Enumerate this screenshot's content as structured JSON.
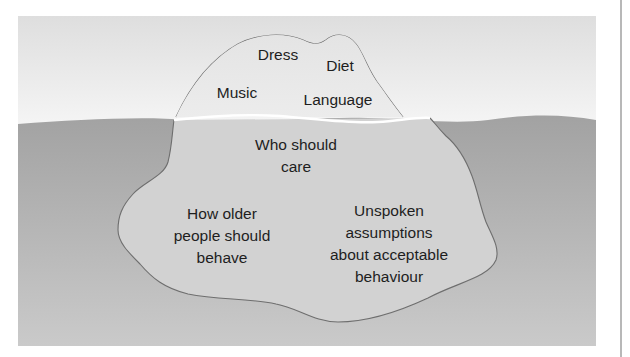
{
  "diagram": {
    "type": "iceberg",
    "colors": {
      "sky_top": "#e0e0e0",
      "sky_bottom": "#f4f4f4",
      "water_top": "#a3a3a3",
      "water_bottom": "#c9c9c9",
      "ice_above": "#e6e6e6",
      "ice_below": "#d0d0d0",
      "outline": "#6e6e6e",
      "waterline": "#ffffff",
      "text": "#1e1e1e"
    },
    "above_water": {
      "labels": [
        "Dress",
        "Diet",
        "Music",
        "Language"
      ]
    },
    "below_water": {
      "labels": [
        "Who should\ncare",
        "How older\npeople should\nbehave",
        "Unspoken\nassumptions\nabout acceptable\nbehaviour"
      ],
      "who_should_care": [
        "Who should",
        "care"
      ],
      "how_older_people": [
        "How older",
        "people should",
        "behave"
      ],
      "unspoken_assumptions": [
        "Unspoken",
        "assumptions",
        "about acceptable",
        "behaviour"
      ]
    }
  }
}
